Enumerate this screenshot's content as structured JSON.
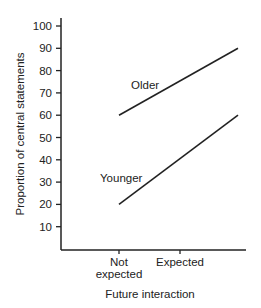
{
  "chart_data": {
    "type": "line",
    "title": "",
    "xlabel": "Future interaction",
    "ylabel": "Proportion of central statements",
    "categories": [
      "Not expected",
      "Expected"
    ],
    "category_lines": [
      [
        "Not",
        "expected"
      ],
      [
        "Expected"
      ]
    ],
    "yticks": [
      10,
      20,
      30,
      40,
      50,
      60,
      70,
      80,
      90,
      100
    ],
    "ylim": [
      0,
      100
    ],
    "grid": false,
    "legend": "inline labels",
    "series": [
      {
        "name": "Older",
        "values": [
          60,
          75
        ],
        "line_end_value": 90
      },
      {
        "name": "Younger",
        "values": [
          20,
          40
        ],
        "line_end_value": 60
      }
    ]
  }
}
